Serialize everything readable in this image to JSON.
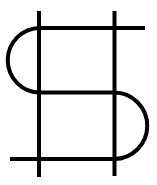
{
  "figure": {
    "stroke_color": "#000000",
    "background_color": "#ffffff",
    "stroke_width": 4
  }
}
